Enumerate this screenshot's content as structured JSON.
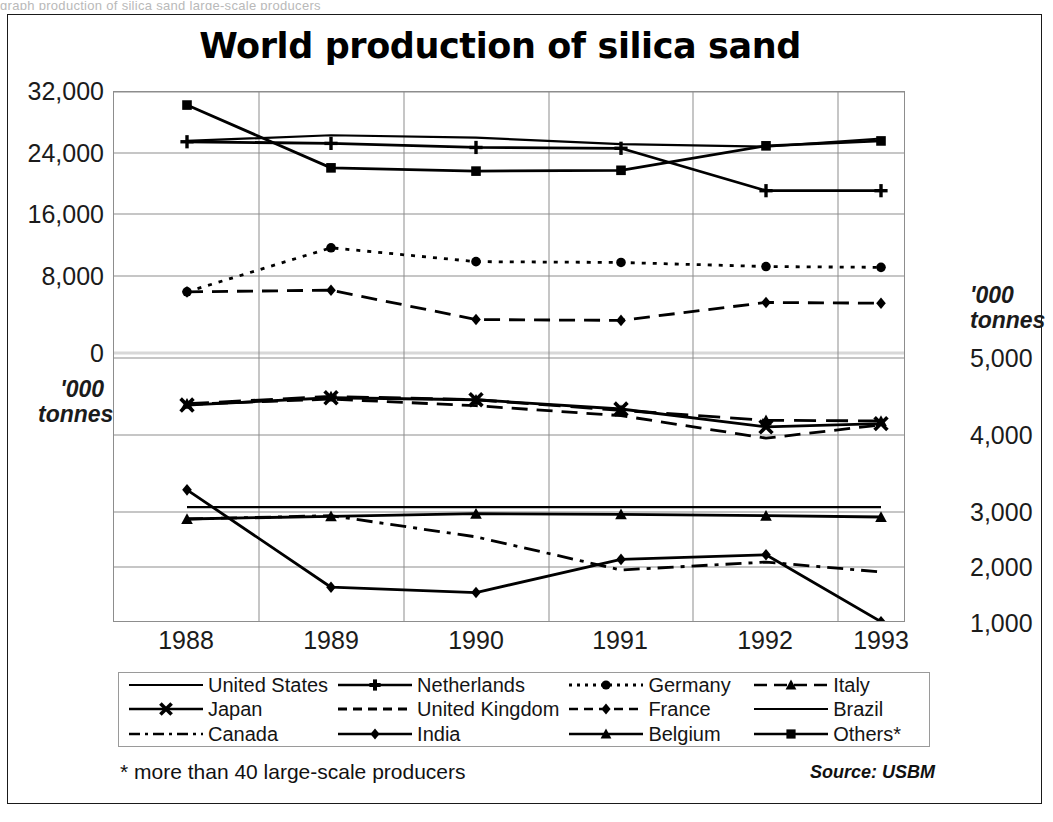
{
  "scan_artifact_text": "graph production of silica sand large-scale producers",
  "chart": {
    "title": "World production of silica sand",
    "footnote": "* more than 40 large-scale producers",
    "source": "Source: USBM",
    "unit_left": "'000\ntonnes",
    "unit_left_line1": "'000",
    "unit_left_line2": "tonnes",
    "unit_right_line1": "'000",
    "unit_right_line2": "tonnes",
    "axis_color": "#8d8d8d",
    "line_color": "#000000"
  },
  "chart_data": {
    "type": "line",
    "title": "World production of silica sand",
    "xlabel": "",
    "ylabel": "'000 tonnes",
    "categories": [
      "1988",
      "1989",
      "1990",
      "1991",
      "1992",
      "1993"
    ],
    "x": [
      1988,
      1989,
      1990,
      1991,
      1992,
      1993
    ],
    "grid": true,
    "legend_position": "bottom",
    "note": "Two stacked panels share one frame: the upper panel uses the left-hand axis (0 to 32,000 '000 tonnes) and the lower panel uses the right-hand axis (1,000 to 5,000 '000 tonnes).",
    "axes": {
      "left": {
        "label": "'000 tonnes",
        "ticks": [
          "32,000",
          "24,000",
          "16,000",
          "8,000",
          "0"
        ],
        "tick_values": [
          32000,
          24000,
          16000,
          8000,
          0
        ],
        "range": [
          0,
          32000
        ],
        "panel": "upper"
      },
      "right": {
        "label": "'000 tonnes",
        "ticks": [
          "5,000",
          "4,000",
          "3,000",
          "2,000",
          "1,000"
        ],
        "tick_values": [
          5000,
          4000,
          3000,
          2000,
          1000
        ],
        "range": [
          1000,
          5000
        ],
        "panel": "lower"
      }
    },
    "series": [
      {
        "name": "United States",
        "axis": "left",
        "marker": "none",
        "dash": "solid",
        "values": [
          26000,
          26700,
          26400,
          25600,
          25300,
          26300
        ]
      },
      {
        "name": "Netherlands",
        "axis": "left",
        "marker": "plus",
        "dash": "solid",
        "values": [
          25900,
          25700,
          25200,
          25100,
          19900,
          19900
        ]
      },
      {
        "name": "Germany",
        "axis": "left",
        "marker": "circle",
        "dash": "dotted",
        "values": [
          7500,
          12900,
          11200,
          11100,
          10600,
          10500
        ]
      },
      {
        "name": "France",
        "axis": "left",
        "marker": "diamond",
        "dash": "dashed",
        "values": [
          7500,
          7700,
          4100,
          4000,
          6200,
          6100
        ]
      },
      {
        "name": "Others*",
        "axis": "left",
        "marker": "square",
        "dash": "solid",
        "values": [
          30400,
          22700,
          22300,
          22400,
          25400,
          26000
        ]
      },
      {
        "name": "Japan",
        "axis": "left-lower-panel-x",
        "marker": "x",
        "dash": "solid",
        "values": [
          4290,
          4400,
          4370,
          4230,
          3960,
          4010
        ]
      },
      {
        "name": "United Kingdom",
        "axis": "right",
        "marker": "none",
        "dash": "dashed",
        "values": [
          4300,
          4380,
          4280,
          4130,
          3790,
          3990
        ]
      },
      {
        "name": "Italy",
        "axis": "right",
        "marker": "triangle",
        "dash": "longdash",
        "values": [
          4310,
          4420,
          4370,
          4210,
          4060,
          4050
        ]
      },
      {
        "name": "Brazil",
        "axis": "right",
        "marker": "none",
        "dash": "solid",
        "values": [
          2750,
          2750,
          2750,
          2750,
          2750,
          2750
        ]
      },
      {
        "name": "Belgium",
        "axis": "right",
        "marker": "triangle",
        "dash": "solid",
        "values": [
          2570,
          2610,
          2650,
          2640,
          2620,
          2600
        ]
      },
      {
        "name": "Canada",
        "axis": "right",
        "marker": "none",
        "dash": "dashdot",
        "values": [
          2570,
          2620,
          2300,
          1800,
          1920,
          1770
        ]
      },
      {
        "name": "India",
        "axis": "right",
        "marker": "diamond",
        "dash": "solid",
        "values": [
          3010,
          1540,
          1460,
          1960,
          2030,
          1020
        ]
      }
    ]
  },
  "legend": {
    "items": [
      {
        "label": "United States",
        "key": "line-plain"
      },
      {
        "label": "Netherlands",
        "key": "line-plus"
      },
      {
        "label": "Germany",
        "key": "dotted-circle"
      },
      {
        "label": "Italy",
        "key": "longdash-triangle"
      },
      {
        "label": "Japan",
        "key": "line-x"
      },
      {
        "label": "United Kingdom",
        "key": "dashed-plain"
      },
      {
        "label": "France",
        "key": "dashed-diamond"
      },
      {
        "label": "Brazil",
        "key": "line-plain"
      },
      {
        "label": "Canada",
        "key": "dashdot-plain"
      },
      {
        "label": "India",
        "key": "line-diamond"
      },
      {
        "label": "Belgium",
        "key": "line-triangle"
      },
      {
        "label": "Others*",
        "key": "line-square"
      }
    ]
  }
}
